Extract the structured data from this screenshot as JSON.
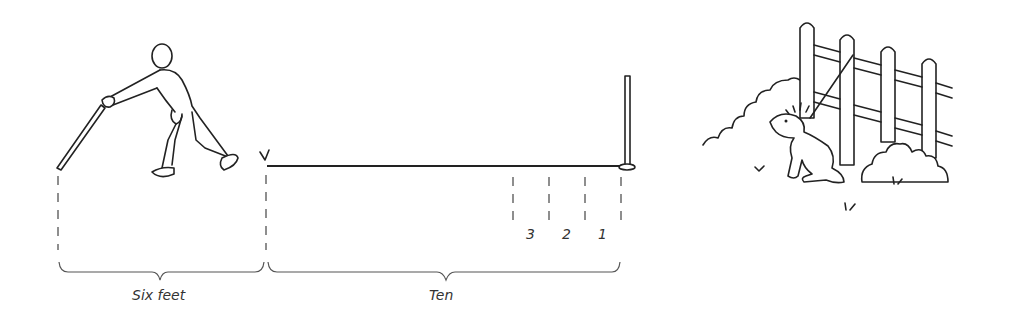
{
  "diagram": {
    "labels": {
      "left_span": "Six feet",
      "right_span": "Ten",
      "markers": [
        "3",
        "2",
        "1"
      ]
    },
    "elements": {
      "figure": "person-throwing-stick",
      "pole": "upright-pole",
      "scene": "dog-by-fence-in-bushes"
    }
  }
}
